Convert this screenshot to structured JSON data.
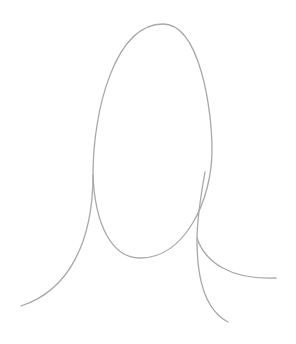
{
  "drawing": {
    "stroke_color": "#a8a8a8",
    "stroke_width": 1.3,
    "background": "#ffffff",
    "strokes": [
      {
        "name": "head-loop",
        "d": "M 93 175 C 93 110, 115 24, 163 24 C 200 24, 212 110, 212 150 C 212 200, 185 258, 140 258 C 112 258, 95 225, 93 175"
      },
      {
        "name": "left-tail",
        "d": "M 93 175 C 93 240, 70 290, 21 306"
      },
      {
        "name": "right-stem",
        "d": "M 205 172 C 200 200, 197 220, 197 240 C 197 280, 205 310, 228 322"
      },
      {
        "name": "right-branch",
        "d": "M 197 238 C 205 262, 230 280, 276 278"
      }
    ]
  }
}
